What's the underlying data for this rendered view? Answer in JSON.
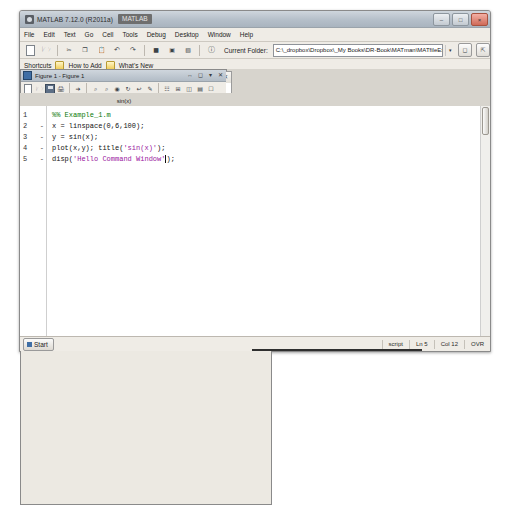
{
  "window": {
    "title": "MATLAB 7.12.0 (R2011a)",
    "selected_title_fragment": "MATLAB",
    "minimize": "–",
    "maximize": "□",
    "close": "×"
  },
  "menubar": {
    "items": [
      "File",
      "Edit",
      "Text",
      "Go",
      "Cell",
      "Tools",
      "Debug",
      "Desktop",
      "Window",
      "Help"
    ]
  },
  "toolbar": {
    "current_folder_label": "Current Folder:",
    "current_folder_value": "C:\\_dropbox\\Dropbox\\_My Books\\DR-Book\\MATman\\MATfileExamples",
    "dropdown_caret": "▾",
    "browse_icon": "browse-folder-icon",
    "up_icon": "up-one-level-icon",
    "icons": [
      "new-file-icon",
      "open-file-icon",
      "cut-icon",
      "copy-icon",
      "paste-icon",
      "undo-icon",
      "redo-icon",
      "simulink-icon",
      "guide-icon",
      "profiler-icon",
      "help-icon"
    ]
  },
  "shortcuts_bar": {
    "label": "Shortcuts",
    "items": [
      "How to Add",
      "What's New"
    ]
  },
  "command_window": {
    "title": "Command Window",
    "output": "Hello Command Window",
    "prompt_fx": "fx",
    "prompt": ">>",
    "buttons": [
      "undock-icon",
      "maximize-icon",
      "menu-icon",
      "close-icon"
    ]
  },
  "figure_window": {
    "title": "Figure 1 - Figure 1",
    "toolbar_icons": [
      "new-figure-icon",
      "open-figure-icon",
      "save-figure-icon",
      "print-icon",
      "pointer-icon",
      "zoom-in-icon",
      "zoom-out-icon",
      "pan-icon",
      "rotate3d-icon",
      "datacursor-icon",
      "brush-icon",
      "colorbar-icon",
      "legend-icon",
      "hide-plot-tools-icon",
      "show-plot-tools-icon",
      "dock-icon"
    ],
    "buttons": [
      "undock-icon",
      "maximize-icon",
      "menu-icon",
      "close-icon"
    ]
  },
  "editor": {
    "title": "Editor - C:\\_dropbox\\Dropbox\\_My Books\\DR-Book\\MATman\\MATfileExamples...",
    "toolbar_icons": [
      "new-file-icon",
      "open-file-icon",
      "save-file-icon",
      "print-icon",
      "cut-icon",
      "copy-icon",
      "paste-icon",
      "undo-icon",
      "redo-icon",
      "run-icon",
      "breakpoint-icon",
      "step-icon",
      "step-in-icon",
      "step-out-icon",
      "continue-icon",
      "quit-debug-icon",
      "stack-icon"
    ],
    "cell_toolbar": {
      "icons": [
        "insert-cell-icon",
        "insert-cell-divider-icon"
      ],
      "minus_label": "–",
      "value_1": "1.0",
      "plus_label": "+",
      "divide_label": "÷",
      "value_2": "11",
      "mult_label": "×",
      "more_icons": [
        "eval-cell-icon",
        "eval-cell-advance-icon",
        "eval-file-icon"
      ]
    },
    "code": [
      {
        "num": "1",
        "marker": "",
        "text": "%% Example_1.m",
        "kind": "comment"
      },
      {
        "num": "2",
        "marker": "-",
        "text": "x = linspace(0,6,100);",
        "kind": "code"
      },
      {
        "num": "3",
        "marker": "-",
        "text": "y = sin(x);",
        "kind": "code"
      },
      {
        "num": "4",
        "marker": "-",
        "text": "plot(x,y); title('sin(x)');",
        "kind": "code-str",
        "pre": "plot(x,y); title(",
        "str": "'sin(x)'",
        "post": ");"
      },
      {
        "num": "5",
        "marker": "-",
        "text": "disp('Hello Command Window');",
        "kind": "code-str",
        "pre": "disp(",
        "str": "'Hello Command Window'",
        "post": ");"
      }
    ],
    "buttons": [
      "undock-icon",
      "maximize-icon",
      "menu-icon",
      "close-icon"
    ]
  },
  "status_bar": {
    "start_button": "Start",
    "file_type": "script",
    "line": "Ln 5",
    "column": "Col 12",
    "overwrite": "OVR"
  },
  "chart_data": {
    "type": "line",
    "title": "sin(x)",
    "xlabel": "",
    "ylabel": "",
    "xlim": [
      0,
      6
    ],
    "ylim": [
      -1,
      1
    ],
    "xticks": [
      "0",
      "1",
      "2",
      "3",
      "4",
      "5",
      "6"
    ],
    "yticks": [
      "1",
      "0.5",
      "0",
      "-0.5",
      "-1"
    ],
    "grid": false,
    "legend": null,
    "series": [
      {
        "name": "sin(x)",
        "color": "#1f4ea8",
        "expression": "y = sin(x)",
        "x": [
          0,
          0.3,
          0.61,
          0.91,
          1.21,
          1.52,
          1.82,
          2.12,
          2.42,
          2.73,
          3.03,
          3.33,
          3.64,
          3.94,
          4.24,
          4.55,
          4.85,
          5.15,
          5.45,
          5.76,
          6.0
        ],
        "y": [
          0.0,
          0.296,
          0.573,
          0.79,
          0.936,
          0.999,
          0.969,
          0.85,
          0.662,
          0.398,
          0.112,
          -0.189,
          -0.483,
          -0.715,
          -0.884,
          -0.987,
          -0.993,
          -0.907,
          -0.739,
          -0.5,
          -0.279
        ]
      }
    ]
  }
}
